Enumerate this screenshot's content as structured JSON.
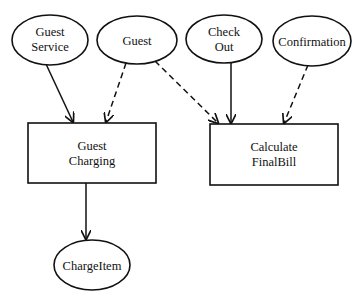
{
  "diagram": {
    "type": "use-case / dependency diagram",
    "nodes": {
      "guest_service": {
        "shape": "ellipse",
        "lines": [
          "Guest",
          "Service"
        ],
        "cx": 50,
        "cy": 40,
        "rx": 38,
        "ry": 25
      },
      "guest": {
        "shape": "ellipse",
        "lines": [
          "Guest"
        ],
        "cx": 137,
        "cy": 40,
        "rx": 40,
        "ry": 24
      },
      "check_out": {
        "shape": "ellipse",
        "lines": [
          "Check",
          "Out"
        ],
        "cx": 224,
        "cy": 39,
        "rx": 38,
        "ry": 24
      },
      "confirmation": {
        "shape": "ellipse",
        "lines": [
          "Confirmation"
        ],
        "cx": 312,
        "cy": 41,
        "rx": 39,
        "ry": 25
      },
      "guest_charging": {
        "shape": "rect",
        "lines": [
          "Guest",
          "Charging"
        ],
        "x": 28,
        "y": 123,
        "w": 128,
        "h": 60
      },
      "calculate_finalbill": {
        "shape": "rect",
        "lines": [
          "Calculate",
          "FinalBill"
        ],
        "x": 210,
        "y": 124,
        "w": 128,
        "h": 61
      },
      "chargeitem": {
        "shape": "ellipse",
        "lines": [
          "ChargeItem"
        ],
        "cx": 92,
        "cy": 265,
        "rx": 38,
        "ry": 25
      }
    },
    "edges": [
      {
        "from": "Guest Service",
        "to": "Guest Charging",
        "style": "solid"
      },
      {
        "from": "Guest",
        "to": "Guest Charging",
        "style": "dashed"
      },
      {
        "from": "Guest",
        "to": "Calculate FinalBill",
        "style": "dashed"
      },
      {
        "from": "Check Out",
        "to": "Calculate FinalBill",
        "style": "solid"
      },
      {
        "from": "Confirmation",
        "to": "Calculate FinalBill",
        "style": "dashed"
      },
      {
        "from": "Guest Charging",
        "to": "ChargeItem",
        "style": "solid"
      }
    ]
  }
}
